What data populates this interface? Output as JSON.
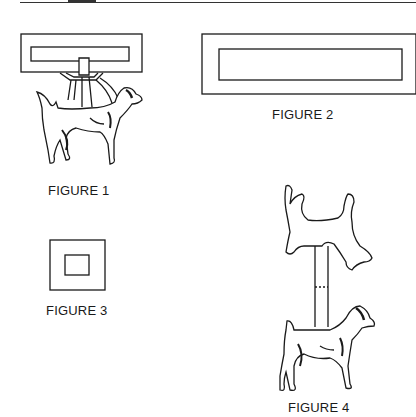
{
  "page": {
    "top_rule": true
  },
  "figures": [
    {
      "id": "figure-1",
      "caption": "FIGURE 1",
      "description": "Dog suspended in harness/sling from a rectangular frame"
    },
    {
      "id": "figure-2",
      "caption": "FIGURE 2",
      "description": "Long rectangle frame with inner rectangle"
    },
    {
      "id": "figure-3",
      "caption": "FIGURE 3",
      "description": "Square with smaller inner square"
    },
    {
      "id": "figure-4",
      "caption": "FIGURE 4",
      "description": "Dog silhouette cutout mounted on a post above a standing dog"
    }
  ],
  "colors": {
    "ink": "#1a1a1a",
    "paper": "#ffffff"
  }
}
